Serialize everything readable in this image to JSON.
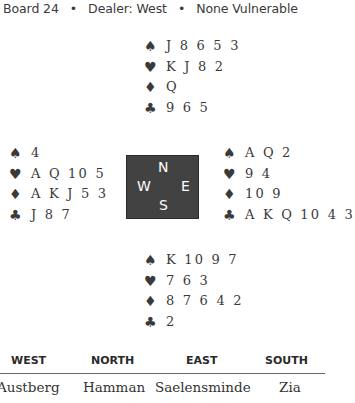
{
  "header": {
    "board": "Board 24",
    "separator": "•",
    "dealer": "Dealer: West",
    "vulnerability": "None Vulnerable"
  },
  "suit_symbols": {
    "spades": "♠",
    "hearts": "♥",
    "diamonds": "♦",
    "clubs": "♣"
  },
  "hands": {
    "north": {
      "spades": "J 8 6 5 3",
      "hearts": "K J 8 2",
      "diamonds": "Q",
      "clubs": "9 6 5"
    },
    "west": {
      "spades": "4",
      "hearts": "A Q 10 5",
      "diamonds": "A K J 5 3",
      "clubs": "J 8 7"
    },
    "east": {
      "spades": "A Q 2",
      "hearts": "9 4",
      "diamonds": "10 9",
      "clubs": "A K Q 10 4 3"
    },
    "south": {
      "spades": "K 10 9 7",
      "hearts": "7 6 3",
      "diamonds": "8 7 6 4 2",
      "clubs": "2"
    }
  },
  "compass": {
    "n": "N",
    "w": "W",
    "e": "E",
    "s": "S"
  },
  "players_table": {
    "headers": [
      "WEST",
      "NORTH",
      "EAST",
      "SOUTH"
    ],
    "names": [
      "Austberg",
      "Hamman",
      "Saelensminde",
      "Zia"
    ]
  }
}
